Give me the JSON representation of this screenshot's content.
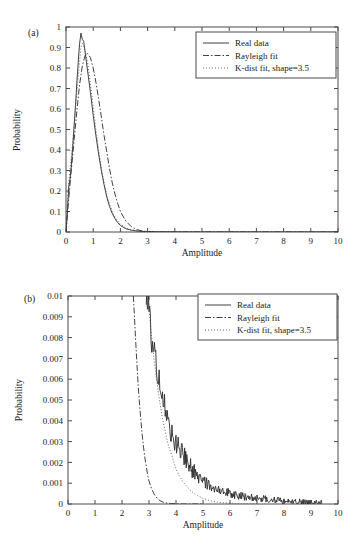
{
  "figure": {
    "panel_a_label": "(a)",
    "panel_b_label": "(b)"
  },
  "legend": {
    "real": "Real data",
    "rayleigh": "Rayleigh fit",
    "kdist": "K-dist fit, shape=3.5"
  },
  "chart_data": [
    {
      "type": "line",
      "panel": "(a)",
      "title": "",
      "xlabel": "Amplitude",
      "ylabel": "Probability",
      "xlim": [
        0,
        10
      ],
      "ylim": [
        0,
        1
      ],
      "xticks": [
        "0",
        "1",
        "2",
        "3",
        "4",
        "5",
        "6",
        "7",
        "8",
        "9",
        "10"
      ],
      "yticks": [
        "0",
        "0.1",
        "0.2",
        "0.3",
        "0.4",
        "0.5",
        "0.6",
        "0.7",
        "0.8",
        "0.9",
        "1"
      ],
      "grid": false,
      "legend_position": "top-right",
      "legend": [
        "Real data",
        "Rayleigh fit",
        "K-dist fit, shape=3.5"
      ],
      "series": [
        {
          "name": "Real data",
          "style": "solid",
          "x": [
            0.0,
            0.05,
            0.1,
            0.15,
            0.2,
            0.25,
            0.3,
            0.35,
            0.4,
            0.45,
            0.5,
            0.55,
            0.6,
            0.65,
            0.7,
            0.75,
            0.8,
            0.9,
            1.0,
            1.1,
            1.2,
            1.3,
            1.4,
            1.5,
            1.6,
            1.7,
            1.8,
            1.9,
            2.0,
            2.2,
            2.4,
            2.6,
            2.8,
            3.0,
            3.2,
            3.5,
            4.0,
            4.5,
            5.0,
            6.0,
            7.0,
            8.0,
            9.0,
            10.0
          ],
          "y": [
            0.0,
            0.1,
            0.22,
            0.26,
            0.33,
            0.42,
            0.52,
            0.62,
            0.73,
            0.83,
            0.92,
            0.97,
            0.94,
            0.93,
            0.88,
            0.83,
            0.78,
            0.68,
            0.57,
            0.47,
            0.38,
            0.3,
            0.23,
            0.17,
            0.125,
            0.091,
            0.065,
            0.046,
            0.032,
            0.016,
            0.009,
            0.005,
            0.003,
            0.0018,
            0.0012,
            0.0007,
            0.0004,
            0.0002,
            0.0001,
            5e-05,
            2e-05,
            1e-05,
            5e-06,
            0.0
          ]
        },
        {
          "name": "Rayleigh fit",
          "style": "dashdot",
          "x": [
            0.0,
            0.1,
            0.2,
            0.3,
            0.4,
            0.5,
            0.6,
            0.7,
            0.75,
            0.8,
            0.9,
            1.0,
            1.1,
            1.2,
            1.3,
            1.4,
            1.5,
            1.6,
            1.7,
            1.8,
            1.9,
            2.0,
            2.2,
            2.4,
            2.6,
            2.8,
            3.0,
            3.2,
            3.5,
            4.0,
            4.5,
            5.0,
            6.0,
            7.0,
            8.0,
            9.0,
            10.0
          ],
          "y": [
            0.0,
            0.16,
            0.31,
            0.45,
            0.59,
            0.72,
            0.81,
            0.86,
            0.87,
            0.87,
            0.85,
            0.8,
            0.73,
            0.65,
            0.56,
            0.47,
            0.39,
            0.31,
            0.24,
            0.185,
            0.14,
            0.1,
            0.053,
            0.026,
            0.012,
            0.005,
            0.002,
            0.0008,
            0.0002,
            3e-05,
            4e-06,
            0.0,
            0.0,
            0.0,
            0.0,
            0.0,
            0.0
          ]
        },
        {
          "name": "K-dist fit, shape=3.5",
          "style": "dotted",
          "x": [
            0.0,
            0.05,
            0.1,
            0.2,
            0.3,
            0.4,
            0.5,
            0.55,
            0.6,
            0.7,
            0.8,
            0.9,
            1.0,
            1.1,
            1.2,
            1.3,
            1.4,
            1.5,
            1.6,
            1.7,
            1.8,
            1.9,
            2.0,
            2.2,
            2.4,
            2.6,
            2.8,
            3.0,
            3.2,
            3.5,
            4.0,
            4.5,
            5.0,
            6.0,
            7.0,
            8.0,
            9.0,
            10.0
          ],
          "y": [
            0.0,
            0.12,
            0.24,
            0.37,
            0.52,
            0.68,
            0.83,
            0.9,
            0.92,
            0.89,
            0.82,
            0.72,
            0.61,
            0.5,
            0.4,
            0.31,
            0.24,
            0.18,
            0.135,
            0.1,
            0.073,
            0.053,
            0.038,
            0.02,
            0.011,
            0.006,
            0.0032,
            0.0018,
            0.001,
            0.0005,
            0.00015,
            5e-05,
            2e-05,
            3e-06,
            0.0,
            0.0,
            0.0,
            0.0
          ]
        }
      ]
    },
    {
      "type": "line",
      "panel": "(b)",
      "title": "",
      "xlabel": "Amplitude",
      "ylabel": "Probability",
      "xlim": [
        0,
        10
      ],
      "ylim": [
        0,
        0.01
      ],
      "xticks": [
        "0",
        "1",
        "2",
        "3",
        "4",
        "5",
        "6",
        "7",
        "8",
        "9",
        "10"
      ],
      "yticks": [
        "0",
        "0.001",
        "0.002",
        "0.003",
        "0.004",
        "0.005",
        "0.006",
        "0.007",
        "0.008",
        "0.009",
        "0.01"
      ],
      "grid": false,
      "legend_position": "top-right",
      "legend": [
        "Real data",
        "Rayleigh fit",
        "K-dist fit, shape=3.5"
      ],
      "series": [
        {
          "name": "Real data",
          "style": "solid-noisy",
          "x": [
            2.9,
            3.0,
            3.05,
            3.1,
            3.15,
            3.2,
            3.25,
            3.3,
            3.35,
            3.4,
            3.45,
            3.5,
            3.55,
            3.6,
            3.65,
            3.7,
            3.75,
            3.8,
            3.85,
            3.9,
            3.95,
            4.0,
            4.1,
            4.2,
            4.3,
            4.4,
            4.5,
            4.6,
            4.7,
            4.8,
            4.9,
            5.0,
            5.2,
            5.4,
            5.6,
            5.8,
            6.0,
            6.3,
            6.6,
            7.0,
            7.4,
            7.8,
            8.2,
            8.6,
            9.0,
            9.4
          ],
          "y": [
            0.01,
            0.0095,
            0.0086,
            0.0078,
            0.0075,
            0.0073,
            0.0068,
            0.0064,
            0.0061,
            0.0058,
            0.0055,
            0.0052,
            0.0049,
            0.0046,
            0.0043,
            0.004,
            0.0038,
            0.0035,
            0.0033,
            0.0031,
            0.0029,
            0.0028,
            0.0026,
            0.0024,
            0.0022,
            0.002,
            0.0018,
            0.0016,
            0.0015,
            0.0013,
            0.0012,
            0.0011,
            0.0009,
            0.0008,
            0.0007,
            0.0006,
            0.0005,
            0.0004,
            0.0003,
            0.00025,
            0.0002,
            0.00015,
            0.0001,
            8e-05,
            5e-05,
            3e-05
          ],
          "noise_amplitude": 0.0006
        },
        {
          "name": "Rayleigh fit",
          "style": "dashdot",
          "x": [
            2.42,
            2.45,
            2.5,
            2.55,
            2.6,
            2.65,
            2.7,
            2.75,
            2.8,
            2.85,
            2.9,
            2.95,
            3.0,
            3.1,
            3.2,
            3.3,
            3.4,
            3.5,
            3.6,
            3.8,
            4.0,
            4.2,
            4.5,
            5.0
          ],
          "y": [
            0.01,
            0.0093,
            0.008,
            0.0068,
            0.0057,
            0.0048,
            0.004,
            0.0033,
            0.0027,
            0.0022,
            0.0018,
            0.0014,
            0.0011,
            0.00072,
            0.00045,
            0.00028,
            0.00017,
            0.0001,
            6e-05,
            2e-05,
            6e-06,
            2e-06,
            4e-07,
            0.0
          ]
        },
        {
          "name": "K-dist fit, shape=3.5",
          "style": "dotted",
          "x": [
            2.95,
            3.0,
            3.1,
            3.2,
            3.3,
            3.4,
            3.5,
            3.6,
            3.7,
            3.8,
            3.9,
            4.0,
            4.1,
            4.2,
            4.3,
            4.4,
            4.5,
            4.6,
            4.8,
            5.0,
            5.2,
            5.4,
            5.6,
            6.0,
            6.5,
            7.0
          ],
          "y": [
            0.01,
            0.0094,
            0.008,
            0.0068,
            0.0058,
            0.0049,
            0.0041,
            0.0035,
            0.0029,
            0.0025,
            0.0021,
            0.0017,
            0.0014,
            0.0012,
            0.001,
            0.00085,
            0.0007,
            0.00058,
            0.0004,
            0.00027,
            0.00018,
            0.00012,
            8e-05,
            4e-05,
            1e-05,
            3e-06
          ]
        }
      ]
    }
  ]
}
